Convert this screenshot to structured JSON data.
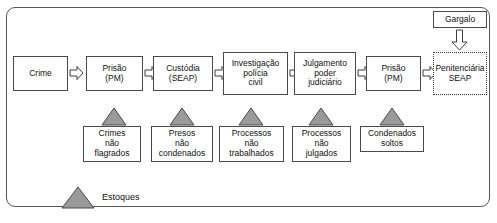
{
  "diagram": {
    "title_visible": false,
    "colors": {
      "stock_triangle_fill": "#9a9a9a",
      "stock_triangle_stroke": "#4a4a4a",
      "box_stroke": "#4a4a4a",
      "frame_stroke": "#585858",
      "arrow_stroke": "#3c3c3c",
      "background": "#ffffff"
    },
    "process_flow": [
      {
        "id": "crime",
        "label": "Crime"
      },
      {
        "id": "prisao-pm-1",
        "label": "Prisão\n(PM)"
      },
      {
        "id": "custodia-seap",
        "label": "Custódia\n(SEAP)"
      },
      {
        "id": "investigacao",
        "label": "Investigação\npolícia\ncivil"
      },
      {
        "id": "julgamento",
        "label": "Julgamento\npoder\njudiciário"
      },
      {
        "id": "prisao-pm-2",
        "label": "Prisão\n(PM)"
      }
    ],
    "sink": {
      "id": "penitenciaria-seap",
      "label": "Penitenciária\nSEAP"
    },
    "bottleneck": {
      "id": "gargalo",
      "label": "Gargalo"
    },
    "stocks": [
      {
        "id": "crimes-nao-flagrados",
        "label": "Crimes\nnão\nflagrados"
      },
      {
        "id": "presos-nao-condenados",
        "label": "Presos\nnão\ncondenados"
      },
      {
        "id": "processos-nao-trabalhados",
        "label": "Processos\nnão\ntrabalhados"
      },
      {
        "id": "processos-nao-julgados",
        "label": "Processos\nnão\njulgados"
      },
      {
        "id": "condenados-soltos",
        "label": "Condenados\nsoltos"
      }
    ],
    "legend": {
      "label": "Estoques"
    }
  }
}
